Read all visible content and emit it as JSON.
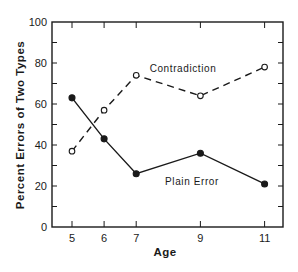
{
  "chart_data": {
    "type": "line",
    "title": "",
    "xlabel": "Age",
    "ylabel": "Percent Errors of Two Types",
    "x": [
      5,
      6,
      7,
      9,
      11
    ],
    "x_tick_labels": [
      "5",
      "6",
      "7",
      "9",
      "11"
    ],
    "y_ticks": [
      0,
      20,
      40,
      60,
      80,
      100
    ],
    "y_tick_labels": [
      "0",
      "20",
      "40",
      "60",
      "80",
      "100"
    ],
    "ylim": [
      0,
      100
    ],
    "grid": false,
    "legend": "none (inline annotations)",
    "series": [
      {
        "name": "Contradiction",
        "style": "dashed",
        "marker": "open-circle",
        "values": [
          37,
          57,
          74,
          64,
          78
        ]
      },
      {
        "name": "Plain Error",
        "style": "solid",
        "marker": "filled-circle",
        "values": [
          63,
          43,
          26,
          36,
          21
        ]
      }
    ],
    "annotations": [
      {
        "text": "Contradiction",
        "near_series": "Contradiction"
      },
      {
        "text": "Plain Error",
        "near_series": "Plain Error"
      }
    ]
  },
  "colors": {
    "ink": "#1a1a1a",
    "background": "#ffffff"
  }
}
